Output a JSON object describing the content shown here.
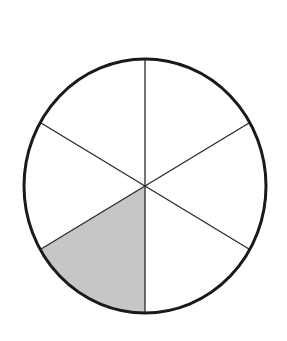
{
  "diagram": {
    "type": "fraction-circle",
    "description": "Circle divided into 6 equal parts with 1 part shaded",
    "total_parts": 6,
    "shaded_parts": 1,
    "fraction_shaded": "1/6",
    "shaded_sector_index": 3,
    "colors": {
      "outline": "#1a1a1a",
      "spokes": "#2a2a2a",
      "shaded_fill": "#c6c6c6",
      "unshaded_fill": "#ffffff",
      "background": "#ffffff"
    },
    "geometry": {
      "center": [
        145,
        186
      ],
      "rx": 121,
      "ry": 127,
      "outline_width": 3,
      "spoke_width": 1.3,
      "spoke_angles_deg": [
        90,
        30,
        -30,
        -90,
        -150,
        150
      ]
    }
  }
}
